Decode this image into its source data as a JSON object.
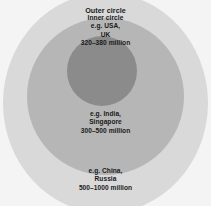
{
  "diagram": {
    "type": "concentric-circles",
    "background_color": "#f4f4f4",
    "rings": [
      {
        "id": "outer",
        "name": "outer-circle",
        "color": "#d9d9d9",
        "title": "Outer circle",
        "examples": "e.g. China,\nRussia",
        "range": "500–1000 million",
        "label_text": "e.g. China,\nRussia\n500–1000 million"
      },
      {
        "id": "middle",
        "name": "middle-circle",
        "color": "#b6b6b6",
        "title": "",
        "examples": "e.g. India,\nSingapore",
        "range": "300–500 million",
        "label_text": "e.g. India,\nSingapore\n300–500 million"
      },
      {
        "id": "inner",
        "name": "inner-circle",
        "color": "#8b8b8b",
        "title": "Inner circle",
        "examples": "e.g. USA,\nUK",
        "range": "320–380 million",
        "label_text": "Inner circle\ne.g. USA,\nUK\n320–380 million"
      }
    ],
    "labels": {
      "outer_title": "Outer circle",
      "inner_block": "Inner circle\ne.g. USA,\nUK\n320–380 million",
      "middle_block": "e.g. India,\nSingapore\n300–500 million",
      "outer_block": "e.g. China,\nRussia\n500–1000 million"
    }
  }
}
